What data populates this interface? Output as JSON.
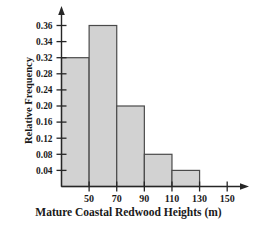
{
  "chart_data": {
    "type": "bar",
    "title": "",
    "xlabel": "Mature Coastal Redwood Heights (m)",
    "ylabel": "Relative Frequency",
    "categories": [
      "30-50",
      "50-70",
      "70-90",
      "90-110",
      "110-130"
    ],
    "values": [
      0.32,
      0.36,
      0.2,
      0.08,
      0.04
    ],
    "bin_edges": [
      30,
      50,
      70,
      90,
      110,
      130
    ],
    "bin_width": 20,
    "xtick_labels": [
      "50",
      "70",
      "90",
      "110",
      "130",
      "150"
    ],
    "xtick_values": [
      50,
      70,
      90,
      110,
      130,
      150
    ],
    "ytick_labels": [
      "0.04",
      "0.08",
      "0.12",
      "0.16",
      "0.20",
      "0.24",
      "0.28",
      "0.32",
      "0.34",
      "0.36"
    ],
    "ytick_values": [
      0.04,
      0.08,
      0.12,
      0.16,
      0.2,
      0.24,
      0.28,
      0.32,
      0.34,
      0.36
    ],
    "xlim": [
      30,
      160
    ],
    "ylim": [
      0,
      0.38
    ],
    "grid": false,
    "legend": false,
    "bar_color": "#d2d2d2",
    "bar_edge_color": "#4a4a4a",
    "axis_color": "#262626",
    "text_color": "#1a1a1a",
    "axis_arrows": true,
    "note": "y-axis tick spacing is visually uniform but numerically irregular above 0.32"
  }
}
